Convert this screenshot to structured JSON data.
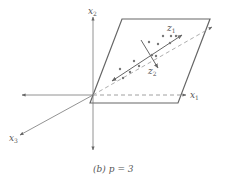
{
  "diagram": {
    "caption": {
      "prefix": "(b)",
      "expr": "p = 3"
    },
    "axes": {
      "x1": {
        "label": "x",
        "sub": "1"
      },
      "x2": {
        "label": "x",
        "sub": "2"
      },
      "x3": {
        "label": "x",
        "sub": "3"
      }
    },
    "components": {
      "z1": {
        "label": "z",
        "sub": "1"
      },
      "z2": {
        "label": "z",
        "sub": "2"
      }
    },
    "colors": {
      "line": "#666666",
      "points": "#777777",
      "background": "#ffffff"
    }
  }
}
